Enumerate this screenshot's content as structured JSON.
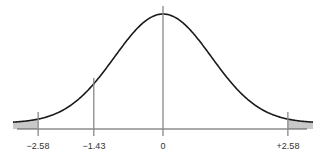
{
  "chart_data": {
    "type": "area",
    "title": "",
    "xlabel": "",
    "ylabel": "",
    "xlim": [
      -3.1,
      3.1
    ],
    "grid": false,
    "legend": null,
    "tick_labels": [
      "−2.58",
      "−1.43",
      "0",
      "+2.58"
    ],
    "tick_values": [
      -2.58,
      -1.43,
      0,
      2.58
    ],
    "shaded_regions": [
      {
        "from": -3.1,
        "to": -2.58,
        "color": "#c8c8c8"
      },
      {
        "from": 2.58,
        "to": 3.1,
        "color": "#c8c8c8"
      }
    ],
    "curve_color": "#1a1a1a",
    "line_color": "#888888"
  },
  "labels": {
    "neg258": "−2.58",
    "neg143": "−1.43",
    "zero": "0",
    "pos258": "+2.58"
  }
}
